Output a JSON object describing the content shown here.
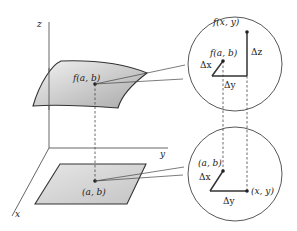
{
  "diagram": {
    "type": "multivariable-increment-illustration",
    "axes": {
      "z": "z",
      "y": "y",
      "x": "x"
    },
    "surface_point_label": "f(a, b)",
    "domain_point_label": "(a, b)",
    "upper_inset": {
      "point1": "f(a, b)",
      "point2": "f(x, y)",
      "dx": "Δx",
      "dy": "Δy",
      "dz": "Δz"
    },
    "lower_inset": {
      "point1": "(a, b)",
      "point2": "(x, y)",
      "dx": "Δx",
      "dy": "Δy"
    },
    "colors": {
      "line": "#333333",
      "surface_fill": "#cfcfcf",
      "plane_fill": "#d6d6d6"
    }
  }
}
